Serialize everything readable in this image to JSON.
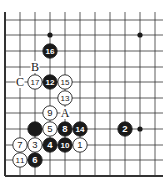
{
  "diagram": {
    "grid": {
      "x": [
        5,
        20,
        35,
        50,
        65,
        80,
        95,
        110,
        125,
        140,
        155
      ],
      "y": [
        20,
        35,
        51,
        67,
        82,
        98,
        113,
        129,
        145,
        160,
        176
      ],
      "x_extend": 163,
      "y_top": 12,
      "edge_left": true,
      "edge_bottom": true
    },
    "hoshi": [
      {
        "col": 3,
        "row": 1
      },
      {
        "col": 9,
        "row": 1
      },
      {
        "col": 9,
        "row": 7
      }
    ],
    "stones": [
      {
        "color": "black",
        "label": "16",
        "col": 3,
        "row": 2
      },
      {
        "color": "white",
        "label": "17",
        "col": 2,
        "row": 4
      },
      {
        "color": "black",
        "label": "12",
        "col": 3,
        "row": 4
      },
      {
        "color": "white",
        "label": "15",
        "col": 4,
        "row": 4
      },
      {
        "color": "white",
        "label": "13",
        "col": 4,
        "row": 5
      },
      {
        "color": "white",
        "label": "9",
        "col": 3,
        "row": 6
      },
      {
        "color": "black",
        "label": "",
        "col": 2,
        "row": 7
      },
      {
        "color": "white",
        "label": "5",
        "col": 3,
        "row": 7
      },
      {
        "color": "black",
        "label": "8",
        "col": 4,
        "row": 7
      },
      {
        "color": "black",
        "label": "14",
        "col": 5,
        "row": 7
      },
      {
        "color": "black",
        "label": "2",
        "col": 8,
        "row": 7
      },
      {
        "color": "white",
        "label": "7",
        "col": 1,
        "row": 8
      },
      {
        "color": "white",
        "label": "3",
        "col": 2,
        "row": 8
      },
      {
        "color": "black",
        "label": "4",
        "col": 3,
        "row": 8
      },
      {
        "color": "black",
        "label": "10",
        "col": 4,
        "row": 8
      },
      {
        "color": "white",
        "label": "1",
        "col": 5,
        "row": 8
      },
      {
        "color": "white",
        "label": "11",
        "col": 1,
        "row": 9
      },
      {
        "color": "black",
        "label": "6",
        "col": 2,
        "row": 9
      }
    ],
    "markers": [
      {
        "label": "B",
        "col": 2,
        "row": 3
      },
      {
        "label": "C",
        "col": 1,
        "row": 4
      },
      {
        "label": "A",
        "col": 4,
        "row": 6
      }
    ],
    "colors": {
      "line": "#333333",
      "black_stone": "#1a1a1a",
      "white_stone": "#ffffff",
      "background": "#ffffff"
    }
  }
}
